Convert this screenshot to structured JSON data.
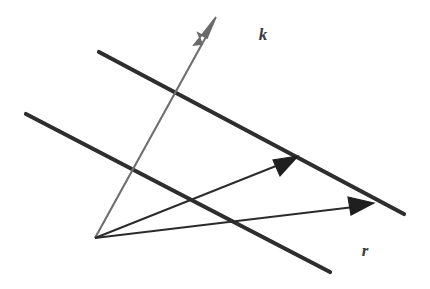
{
  "figure": {
    "background_color": "#ffffff",
    "width": 430,
    "height": 289
  },
  "labels": {
    "k": "k",
    "r": "r"
  },
  "colors": {
    "wavefront_line": "#2e2e2e",
    "k_vector": "#6e6e6e",
    "r_vector": "#2b2b2b",
    "label": "#3b3b3b"
  },
  "geometry": {
    "origin": {
      "x": 95,
      "y": 238
    },
    "wavefront_lines": [
      {
        "name": "upper-wavefront",
        "x1": 99,
        "y1": 52,
        "x2": 404,
        "y2": 214,
        "stroke_width": 4
      },
      {
        "name": "lower-wavefront",
        "x1": 26,
        "y1": 114,
        "x2": 330,
        "y2": 272,
        "stroke_width": 4
      }
    ],
    "k_vector": {
      "name": "k-vector",
      "x1": 95,
      "y1": 238,
      "x2": 214,
      "y2": 22,
      "stroke_width": 2,
      "arrow_tip": {
        "x": 216,
        "y": 18
      }
    },
    "r_vectors": [
      {
        "name": "r-vector-upper",
        "x1": 95,
        "y1": 238,
        "x2": 296,
        "y2": 158,
        "stroke_width": 2,
        "arrow_tip": {
          "x": 298,
          "y": 157
        }
      },
      {
        "name": "r-vector-lower",
        "x1": 95,
        "y1": 238,
        "x2": 370,
        "y2": 205,
        "stroke_width": 2,
        "arrow_tip": {
          "x": 373,
          "y": 204
        }
      }
    ],
    "label_positions": {
      "k": {
        "x": 263,
        "y": 40
      },
      "r": {
        "x": 363,
        "y": 255
      }
    }
  },
  "icons": {
    "k_arrowhead": "arrowhead-icon",
    "r_arrowhead_upper": "arrowhead-icon",
    "r_arrowhead_lower": "arrowhead-icon"
  }
}
